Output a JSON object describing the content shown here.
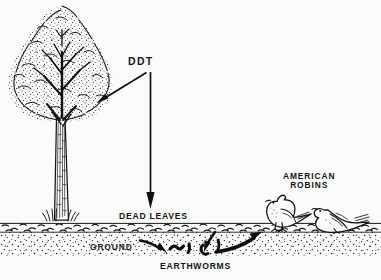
{
  "figure": {
    "background_color": "#fbfbfc",
    "ink_color": "#141414",
    "style": "black and white pen-and-ink line drawing with stipple shading"
  },
  "labels": {
    "ddt": "DDT",
    "dead_leaves": "DEAD LEAVES",
    "ground": "GROUND",
    "earthworms": "EARTHWORMS",
    "american_robins_line1": "AMERICAN",
    "american_robins_line2": "ROBINS"
  },
  "elements": {
    "tree": "deciduous-tree",
    "ground_band": "soil-cross-section",
    "leaf_litter": "dead-leaf-layer",
    "worms": "earthworms-in-soil",
    "robin_standing": "american-robin-standing",
    "robin_fallen": "american-robin-fallen"
  },
  "arrows": [
    {
      "name": "ddt-to-tree",
      "from": "DDT",
      "to": "tree canopy"
    },
    {
      "name": "ddt-to-dead-leaves",
      "from": "DDT",
      "to": "dead leaves"
    },
    {
      "name": "leaves-to-worms-left",
      "from": "dead leaves",
      "to": "earthworms"
    },
    {
      "name": "leaves-to-worms-right",
      "from": "dead leaves",
      "to": "earthworms"
    },
    {
      "name": "worms-to-robin",
      "from": "earthworms",
      "to": "american robin"
    }
  ]
}
